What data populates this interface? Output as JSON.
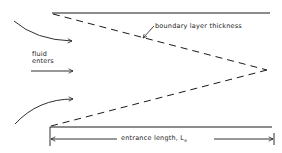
{
  "diagram": {
    "labels": {
      "boundary_layer": "boundary layer thickness",
      "fluid_line1": "fluid",
      "fluid_line2": "enters",
      "entrance_length": "entrance length, L",
      "entrance_length_subscript": "e"
    },
    "colors": {
      "line": "#1a1a1a",
      "background": "#ffffff"
    }
  }
}
